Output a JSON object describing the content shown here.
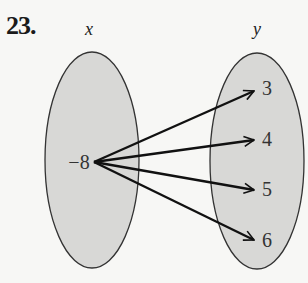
{
  "problem": {
    "number": "23."
  },
  "domain_set": {
    "label": "x",
    "elements": [
      "−8"
    ]
  },
  "range_set": {
    "label": "y",
    "elements": [
      "3",
      "4",
      "5",
      "6"
    ]
  },
  "mappings": [
    {
      "from": "−8",
      "to": "3"
    },
    {
      "from": "−8",
      "to": "4"
    },
    {
      "from": "−8",
      "to": "5"
    },
    {
      "from": "−8",
      "to": "6"
    }
  ],
  "colors": {
    "set_fill": "#d8d8d6",
    "stroke": "#222222",
    "text": "#333333"
  }
}
